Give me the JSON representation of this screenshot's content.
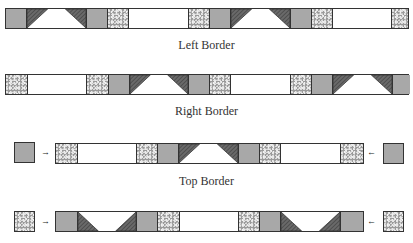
{
  "rows": [
    {
      "label": "Left Border"
    },
    {
      "label": "Right Border"
    },
    {
      "label": "Top Border"
    },
    {
      "label": "Bottom Border"
    }
  ],
  "legend": {
    "gray": "solid gray square",
    "speckle": "speckled print square",
    "white": "white rectangle",
    "trap_up": "flying-geese unit, dark triangles at top corners",
    "trap_down": "flying-geese unit, dark triangles at bottom corners"
  },
  "arrows": {
    "right": "→",
    "left": "←"
  },
  "colors": {
    "outline": "#333333",
    "gray": "#a8a8a8",
    "dark": "#555555",
    "white": "#ffffff"
  }
}
